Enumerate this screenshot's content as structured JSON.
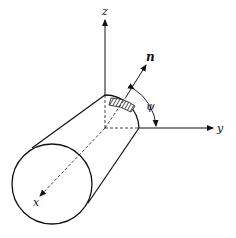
{
  "figure": {
    "labels": {
      "z_axis": "z",
      "y_axis": "y",
      "x_axis": "x",
      "normal": "n",
      "angle": "ψ"
    },
    "colors": {
      "stroke": "#111111",
      "background": "#ffffff"
    }
  }
}
